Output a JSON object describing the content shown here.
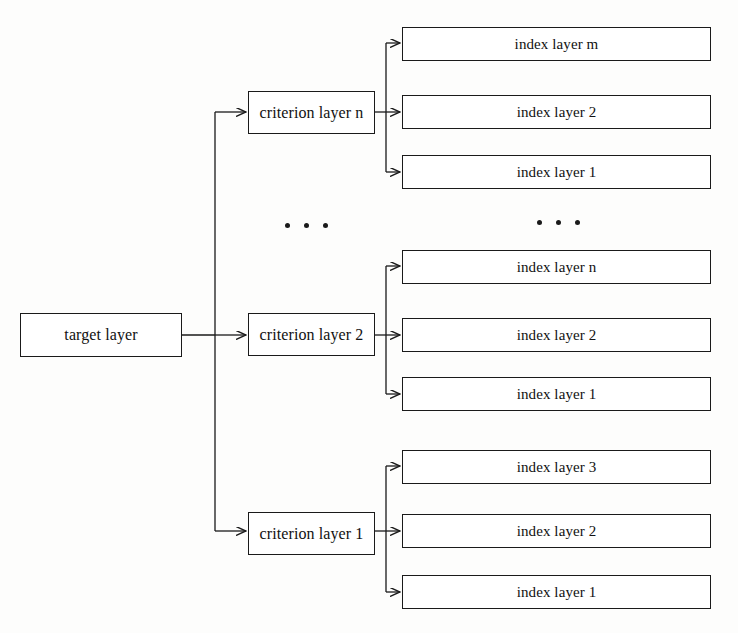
{
  "diagram": {
    "type": "tree",
    "colors": {
      "stroke": "#1a1a1a",
      "box_fill": "#ffffff",
      "background": "#fdfdfc"
    },
    "target": {
      "label": "target layer"
    },
    "groups": [
      {
        "criterion": {
          "label": "criterion layer n"
        },
        "indexes": [
          {
            "label": "index layer m"
          },
          {
            "label": "index layer 2"
          },
          {
            "label": "index layer 1"
          }
        ]
      },
      {
        "criterion": {
          "label": "criterion layer 2"
        },
        "indexes": [
          {
            "label": "index layer n"
          },
          {
            "label": "index layer 2"
          },
          {
            "label": "index layer 1"
          }
        ]
      },
      {
        "criterion": {
          "label": "criterion layer 1"
        },
        "indexes": [
          {
            "label": "index layer 3"
          },
          {
            "label": "index layer 2"
          },
          {
            "label": "index layer 1"
          }
        ]
      }
    ],
    "ellipses": [
      {
        "name": "criterion-column-ellipsis",
        "dots": 3
      },
      {
        "name": "index-column-ellipsis",
        "dots": 3
      }
    ]
  }
}
